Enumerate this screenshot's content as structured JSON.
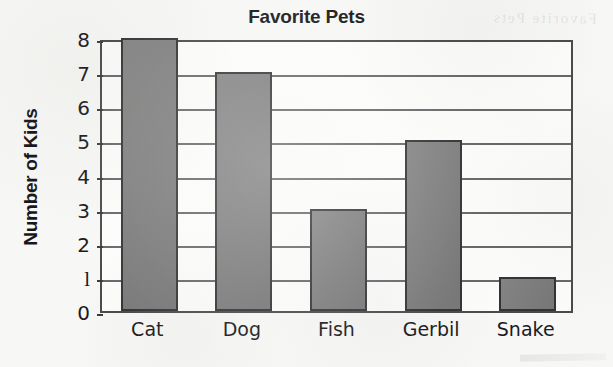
{
  "chart_data": {
    "type": "bar",
    "title": "Favorite Pets",
    "xlabel": "",
    "ylabel": "Number of Kids",
    "categories": [
      "Cat",
      "Dog",
      "Fish",
      "Gerbil",
      "Snake"
    ],
    "values": [
      8,
      7,
      3,
      5,
      1
    ],
    "ylim": [
      0,
      8
    ],
    "ytick_labels": [
      "0",
      "1",
      "2",
      "3",
      "4",
      "5",
      "6",
      "7",
      "8"
    ],
    "ytick_values": [
      0,
      1,
      2,
      3,
      4,
      5,
      6,
      7,
      8
    ],
    "grid": "horizontal",
    "legend": "none",
    "bar_color": "#7d7d7d",
    "bar_edge_color": "#333335",
    "axis_color": "#4a4a4c",
    "gridline_color": "#67676a",
    "plot_background": "#fcfcfb",
    "page_background": "#f7f7f5",
    "text_color": "#1b1b1e"
  },
  "artifacts": {
    "bleed_through_text": "Favorite Pets"
  }
}
